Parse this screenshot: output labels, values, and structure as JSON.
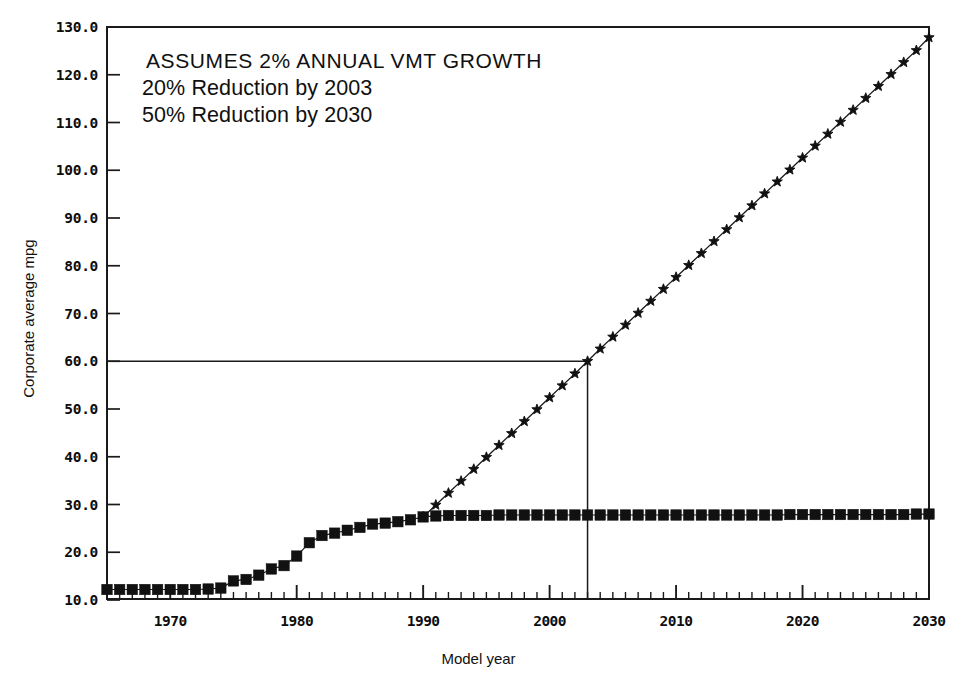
{
  "chart_data": {
    "type": "line",
    "title": "",
    "xlabel": "Model year",
    "ylabel": "Corporate average mpg",
    "xlim": [
      1965,
      2030
    ],
    "ylim": [
      10.0,
      130.0
    ],
    "grid": false,
    "legend": "none",
    "y_tick_labels": [
      "10.0",
      "20.0",
      "30.0",
      "40.0",
      "50.0",
      "60.0",
      "70.0",
      "80.0",
      "90.0",
      "100.0",
      "110.0",
      "120.0",
      "130.0"
    ],
    "y_tick_values": [
      10,
      20,
      30,
      40,
      50,
      60,
      70,
      80,
      90,
      100,
      110,
      120,
      130
    ],
    "x_tick_labels": [
      "1970",
      "1980",
      "1990",
      "2000",
      "2010",
      "2020",
      "2030"
    ],
    "x_tick_values": [
      1970,
      1980,
      1990,
      2000,
      2010,
      2020,
      2030
    ],
    "x_minor_tick_step": 1,
    "annotations": [
      "ASSUMES 2% ANNUAL VMT GROWTH",
      "20% Reduction by 2003",
      "50% Reduction by 2030"
    ],
    "reference_lines": [
      {
        "name": "60-mpg-horizontal",
        "orientation": "horizontal",
        "y": 60.0,
        "x_start": 1965,
        "x_end": 2003
      },
      {
        "name": "2003-vertical",
        "orientation": "vertical",
        "x": 2003,
        "y_start": 10.0,
        "y_end": 60.0
      }
    ],
    "series": [
      {
        "name": "Corporate average mpg (actual / baseline)",
        "marker": "filled-square",
        "x": [
          1965,
          1966,
          1967,
          1968,
          1969,
          1970,
          1971,
          1972,
          1973,
          1974,
          1975,
          1976,
          1977,
          1978,
          1979,
          1980,
          1981,
          1982,
          1983,
          1984,
          1985,
          1986,
          1987,
          1988,
          1989,
          1990,
          1991,
          1992,
          1993,
          1994,
          1995,
          1996,
          1997,
          1998,
          1999,
          2000,
          2001,
          2002,
          2003,
          2004,
          2005,
          2006,
          2007,
          2008,
          2009,
          2010,
          2011,
          2012,
          2013,
          2014,
          2015,
          2016,
          2017,
          2018,
          2019,
          2020,
          2021,
          2022,
          2023,
          2024,
          2025,
          2026,
          2027,
          2028,
          2029,
          2030
        ],
        "y": [
          12.2,
          12.2,
          12.2,
          12.2,
          12.2,
          12.2,
          12.2,
          12.2,
          12.3,
          12.5,
          14.0,
          14.3,
          15.2,
          16.5,
          17.2,
          19.2,
          22.0,
          23.5,
          24.0,
          24.6,
          25.2,
          25.9,
          26.1,
          26.4,
          26.8,
          27.4,
          27.6,
          27.7,
          27.7,
          27.7,
          27.7,
          27.8,
          27.8,
          27.8,
          27.8,
          27.8,
          27.8,
          27.8,
          27.8,
          27.8,
          27.8,
          27.8,
          27.8,
          27.8,
          27.8,
          27.8,
          27.8,
          27.8,
          27.8,
          27.8,
          27.8,
          27.8,
          27.8,
          27.8,
          27.9,
          27.9,
          27.9,
          27.9,
          27.9,
          27.9,
          27.9,
          27.9,
          27.9,
          27.9,
          28.0,
          28.0
        ]
      },
      {
        "name": "Required corporate average mpg (2% VMT growth scenario)",
        "marker": "star",
        "x": [
          1990,
          1991,
          1992,
          1993,
          1994,
          1995,
          1996,
          1997,
          1998,
          1999,
          2000,
          2001,
          2002,
          2003,
          2004,
          2005,
          2006,
          2007,
          2008,
          2009,
          2010,
          2011,
          2012,
          2013,
          2014,
          2015,
          2016,
          2017,
          2018,
          2019,
          2020,
          2021,
          2022,
          2023,
          2024,
          2025,
          2026,
          2027,
          2028,
          2029,
          2030
        ],
        "y": [
          27.4,
          29.9,
          32.4,
          34.9,
          37.4,
          39.9,
          42.4,
          44.9,
          47.4,
          49.9,
          52.4,
          54.9,
          57.4,
          60.0,
          62.6,
          65.1,
          67.6,
          70.1,
          72.6,
          75.1,
          77.6,
          80.1,
          82.6,
          85.1,
          87.6,
          90.1,
          92.6,
          95.1,
          97.6,
          100.1,
          102.6,
          105.1,
          107.6,
          110.1,
          112.6,
          115.1,
          117.6,
          120.1,
          122.6,
          125.1,
          127.8
        ]
      }
    ]
  }
}
